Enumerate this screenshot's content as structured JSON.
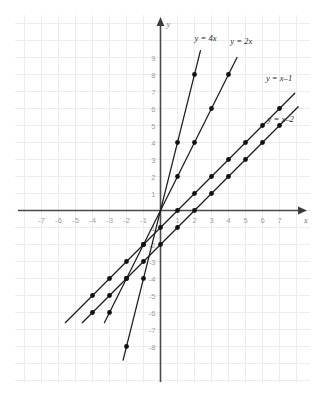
{
  "chart_data": {
    "type": "line",
    "title": "",
    "xlabel": "x",
    "ylabel": "y",
    "xlim": [
      -8,
      8
    ],
    "ylim": [
      -9,
      10
    ],
    "grid": true,
    "legend_position": "inline-labels",
    "x_tick_labels": [
      "-7",
      "-6",
      "-5",
      "-4",
      "-3",
      "-2",
      "-1",
      "1",
      "2",
      "3",
      "4",
      "5",
      "6",
      "7"
    ],
    "y_tick_labels": [
      "9",
      "8",
      "7",
      "6",
      "5",
      "4",
      "3",
      "2",
      "1",
      "-1",
      "-2",
      "-3",
      "-4",
      "-5",
      "-6",
      "-7",
      "-8"
    ],
    "x_ticks": [
      -7,
      -6,
      -5,
      -4,
      -3,
      -2,
      -1,
      1,
      2,
      3,
      4,
      5,
      6,
      7
    ],
    "y_ticks": [
      9,
      8,
      7,
      6,
      5,
      4,
      3,
      2,
      1,
      -1,
      -2,
      -3,
      -4,
      -5,
      -6,
      -7,
      -8
    ],
    "series": [
      {
        "name": "y = 4x",
        "label": "y = 4x",
        "slope": 4,
        "intercept": 0,
        "color": "#1a1a1a",
        "x_start": -2.2,
        "x_end": 2.35,
        "label_x": 2.0,
        "label_y": 10.0,
        "points": [
          {
            "x": -2,
            "y": -8
          },
          {
            "x": -1,
            "y": -4
          },
          {
            "x": 0,
            "y": 0
          },
          {
            "x": 1,
            "y": 4
          },
          {
            "x": 2,
            "y": 8
          }
        ]
      },
      {
        "name": "y = 2x",
        "label": "y = 2x",
        "slope": 2,
        "intercept": 0,
        "color": "#1a1a1a",
        "x_start": -3.3,
        "x_end": 4.5,
        "label_x": 4.1,
        "label_y": 9.8,
        "points": [
          {
            "x": -3,
            "y": -6
          },
          {
            "x": -2,
            "y": -4
          },
          {
            "x": -1,
            "y": -2
          },
          {
            "x": 0,
            "y": 0
          },
          {
            "x": 1,
            "y": 2
          },
          {
            "x": 2,
            "y": 4
          },
          {
            "x": 3,
            "y": 6
          },
          {
            "x": 4,
            "y": 8
          }
        ]
      },
      {
        "name": "y = x-1",
        "label": "y = x–1",
        "slope": 1,
        "intercept": -1,
        "color": "#1a1a1a",
        "x_start": -5.6,
        "x_end": 7.9,
        "label_x": 6.2,
        "label_y": 7.6,
        "points": [
          {
            "x": -4,
            "y": -5
          },
          {
            "x": -3,
            "y": -4
          },
          {
            "x": -2,
            "y": -3
          },
          {
            "x": -1,
            "y": -2
          },
          {
            "x": 0,
            "y": -1
          },
          {
            "x": 1,
            "y": 0
          },
          {
            "x": 2,
            "y": 1
          },
          {
            "x": 3,
            "y": 2
          },
          {
            "x": 4,
            "y": 3
          },
          {
            "x": 5,
            "y": 4
          },
          {
            "x": 6,
            "y": 5
          },
          {
            "x": 7,
            "y": 6
          }
        ]
      },
      {
        "name": "y = x-2",
        "label": "y = x–2",
        "slope": 1,
        "intercept": -2,
        "color": "#1a1a1a",
        "x_start": -4.6,
        "x_end": 8.1,
        "label_x": 6.3,
        "label_y": 5.2,
        "points": [
          {
            "x": -4,
            "y": -6
          },
          {
            "x": -3,
            "y": -5
          },
          {
            "x": -2,
            "y": -4
          },
          {
            "x": -1,
            "y": -3
          },
          {
            "x": 0,
            "y": -2
          },
          {
            "x": 1,
            "y": -1
          },
          {
            "x": 2,
            "y": 0
          },
          {
            "x": 3,
            "y": 1
          },
          {
            "x": 4,
            "y": 2
          },
          {
            "x": 5,
            "y": 3
          },
          {
            "x": 6,
            "y": 4
          },
          {
            "x": 7,
            "y": 5
          }
        ]
      }
    ]
  },
  "axes": {
    "x_axis_label": "x",
    "y_axis_label": "y"
  }
}
